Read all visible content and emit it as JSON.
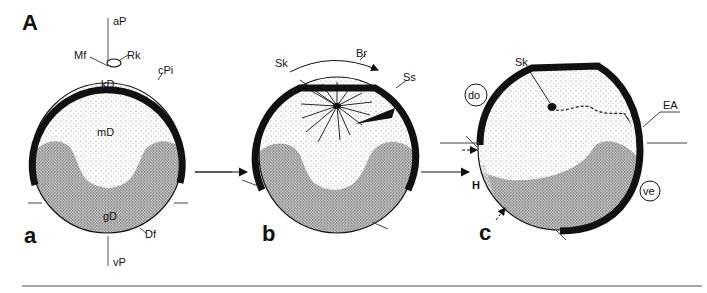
{
  "figure": {
    "title": "A",
    "panels": [
      {
        "id": "a",
        "label": "a",
        "annotations": {
          "animal_pole": "aP",
          "vegetal_pole": "vP",
          "micropyle_funnel": "Mf",
          "polar_body": "Rk",
          "cortical_pigment": "cPi",
          "cortical_yolk": "kD",
          "medium_yolk": "mD",
          "coarse_yolk": "gD",
          "yolk_membrane": "Df"
        }
      },
      {
        "id": "b",
        "label": "b",
        "annotations": {
          "sperm_nucleus": "Sk",
          "rotation": "Br",
          "sperm_trail": "Ss"
        }
      },
      {
        "id": "c",
        "label": "c",
        "annotations": {
          "sperm_nucleus": "Sk",
          "dorsal": "do",
          "ventral": "ve",
          "entry_path": "EA",
          "gray_crescent": "H"
        }
      }
    ],
    "colors": {
      "ink": "#111111",
      "background": "#ffffff",
      "stipple_light": "#bdbdbd",
      "stipple_dark": "#6e6e6e"
    }
  }
}
